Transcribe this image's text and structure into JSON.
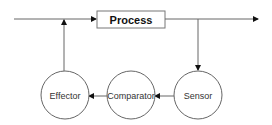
{
  "diagram": {
    "type": "feedback-control-loop",
    "colors": {
      "stroke": "#555555",
      "arrow": "#111111",
      "text": "#333333",
      "background": "#ffffff"
    },
    "nodes": {
      "process": {
        "label": "Process",
        "shape": "rectangle"
      },
      "sensor": {
        "label": "Sensor",
        "shape": "circle"
      },
      "comparator": {
        "label": "Comparator",
        "shape": "circle"
      },
      "effector": {
        "label": "Effector",
        "shape": "circle"
      }
    },
    "edges": [
      {
        "from": "input",
        "to": "process"
      },
      {
        "from": "process",
        "to": "output"
      },
      {
        "from": "process-output",
        "to": "sensor"
      },
      {
        "from": "sensor",
        "to": "comparator"
      },
      {
        "from": "comparator",
        "to": "effector"
      },
      {
        "from": "effector",
        "to": "process-input"
      }
    ]
  }
}
